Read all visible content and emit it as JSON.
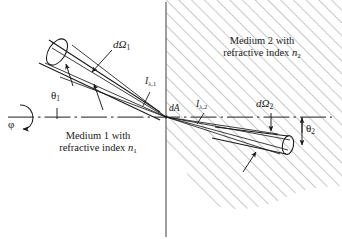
{
  "figure": {
    "background_color": "#ffffff",
    "line_color": "#1a1a1a",
    "hatch_color": "#8a8a8a"
  },
  "labels": {
    "medium1_line1": "Medium 1 with",
    "medium1_line2_prefix": "refractive index ",
    "medium1_line2_symbol": "n",
    "medium1_line2_subscript": "1",
    "medium2_line1": "Medium 2 with",
    "medium2_line2_prefix": "refractive index ",
    "medium2_line2_symbol": "n",
    "medium2_line2_subscript": "2",
    "solid_angle_1_symbol": "dΩ",
    "solid_angle_1_subscript": "1",
    "solid_angle_2_symbol": "dΩ",
    "solid_angle_2_subscript": "2",
    "intensity_1_symbol": "I",
    "intensity_1_subscript": "λ,1",
    "intensity_2_symbol": "I",
    "intensity_2_subscript": "λ,2",
    "area_element": "dA",
    "theta_1_symbol": "θ",
    "theta_1_subscript": "1",
    "theta_2_symbol": "θ",
    "theta_2_subscript": "2",
    "phi_symbol": "φ"
  },
  "geometry": {
    "origin_x": 166,
    "origin_y": 117,
    "interface_x": 166,
    "axis_y": 117,
    "axis_start_x": 8,
    "axis_end_x": 332,
    "incident_angle_deg": 38,
    "refracted_angle_deg": 22,
    "hatch_angle_deg": 45
  }
}
